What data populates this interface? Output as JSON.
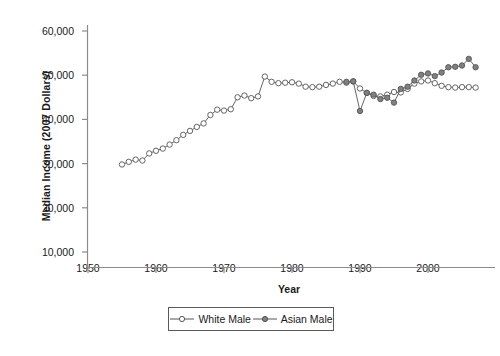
{
  "chart_data": {
    "type": "line",
    "title": "",
    "xlabel": "Year",
    "ylabel": "Median Income (2007 Dollars)",
    "xlim": [
      1950,
      2008
    ],
    "ylim": [
      10000,
      60000
    ],
    "xticks": [
      1950,
      1960,
      1970,
      1980,
      1990,
      2000
    ],
    "xtick_labels": [
      "1950",
      "1960",
      "1970",
      "1980",
      "1990",
      "2000"
    ],
    "yticks": [
      10000,
      20000,
      30000,
      40000,
      50000,
      60000
    ],
    "ytick_labels": [
      "10,000",
      "20,000",
      "30,000",
      "40,000",
      "50,000",
      "60,000"
    ],
    "grid": false,
    "legend_position": "below-axes",
    "series": [
      {
        "name": "White Male",
        "marker": "open-circle",
        "color": "#555555",
        "marker_fill": "#ffffff",
        "x": [
          1955,
          1956,
          1957,
          1958,
          1959,
          1960,
          1961,
          1962,
          1963,
          1964,
          1965,
          1966,
          1967,
          1968,
          1969,
          1970,
          1971,
          1972,
          1973,
          1974,
          1975,
          1976,
          1977,
          1978,
          1979,
          1980,
          1981,
          1982,
          1983,
          1984,
          1985,
          1986,
          1987,
          1988,
          1989,
          1990,
          1991,
          1992,
          1993,
          1994,
          1995,
          1996,
          1997,
          1998,
          1999,
          2000,
          2001,
          2002,
          2003,
          2004,
          2005,
          2006,
          2007
        ],
        "y": [
          29800,
          30400,
          30900,
          30700,
          32300,
          32900,
          33400,
          34300,
          35300,
          36500,
          37400,
          38300,
          39100,
          41000,
          42200,
          42000,
          42300,
          45000,
          45400,
          44800,
          45200,
          49700,
          48500,
          48200,
          48300,
          48400,
          48100,
          47400,
          47300,
          47400,
          47800,
          48100,
          48500,
          48300,
          48600,
          47000,
          46000,
          45300,
          45200,
          45600,
          46200,
          46100,
          46900,
          48100,
          48600,
          48800,
          48200,
          47600,
          47300,
          47200,
          47300,
          47300,
          47200
        ]
      },
      {
        "name": "Asian Male",
        "marker": "filled-circle",
        "color": "#555555",
        "marker_fill": "#808080",
        "x": [
          1988,
          1989,
          1990,
          1991,
          1992,
          1993,
          1994,
          1995,
          1996,
          1997,
          1998,
          1999,
          2000,
          2001,
          2002,
          2003,
          2004,
          2005,
          2006,
          2007
        ],
        "y": [
          48500,
          48600,
          41900,
          46000,
          45600,
          44600,
          44900,
          43800,
          46900,
          47400,
          48800,
          50100,
          50400,
          49800,
          50600,
          51800,
          51900,
          52200,
          53700,
          51800
        ]
      }
    ]
  }
}
